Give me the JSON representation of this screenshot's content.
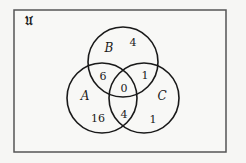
{
  "diagram": {
    "type": "venn-3",
    "universe": {
      "label": "𝔘",
      "frame": {
        "x": 14,
        "y": 10,
        "width": 212,
        "height": 142
      }
    },
    "colors": {
      "background": "#f6f6f4",
      "frame": "#555555",
      "circle_stroke": "#1a1a1a",
      "text": "#1a1a1a"
    },
    "sets": [
      {
        "name": "A",
        "label": "A",
        "cx": 102,
        "cy": 98,
        "r": 35
      },
      {
        "name": "B",
        "label": "B",
        "cx": 123,
        "cy": 62,
        "r": 35
      },
      {
        "name": "C",
        "label": "C",
        "cx": 144,
        "cy": 98,
        "r": 35
      }
    ],
    "regions": {
      "B_only": "4",
      "A_and_B_only": "6",
      "B_and_C_only": "1",
      "A_and_B_and_C": "0",
      "A_only": "16",
      "A_and_C_only": "4",
      "C_only": "1"
    }
  }
}
